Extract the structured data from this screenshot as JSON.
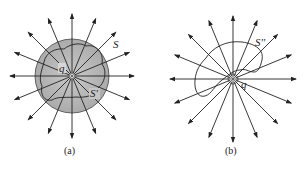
{
  "figure": {
    "panel_a": {
      "caption": "(a)",
      "charge_label": "q",
      "outer_surface_label": "S",
      "sphere_label": "S'",
      "center": [
        72,
        76
      ],
      "sphere_radius": 37,
      "sphere_fill": "#b8b8b8",
      "field_line_count": 16,
      "field_line_length": 62
    },
    "panel_b": {
      "caption": "(b)",
      "charge_label": "q",
      "surface_label": "S''",
      "center": [
        233,
        79
      ],
      "field_line_count": 16,
      "field_line_length": 63
    },
    "colors": {
      "line": "#222222",
      "sphere_fill": "#b8b8b8",
      "background": "#ffffff"
    }
  }
}
